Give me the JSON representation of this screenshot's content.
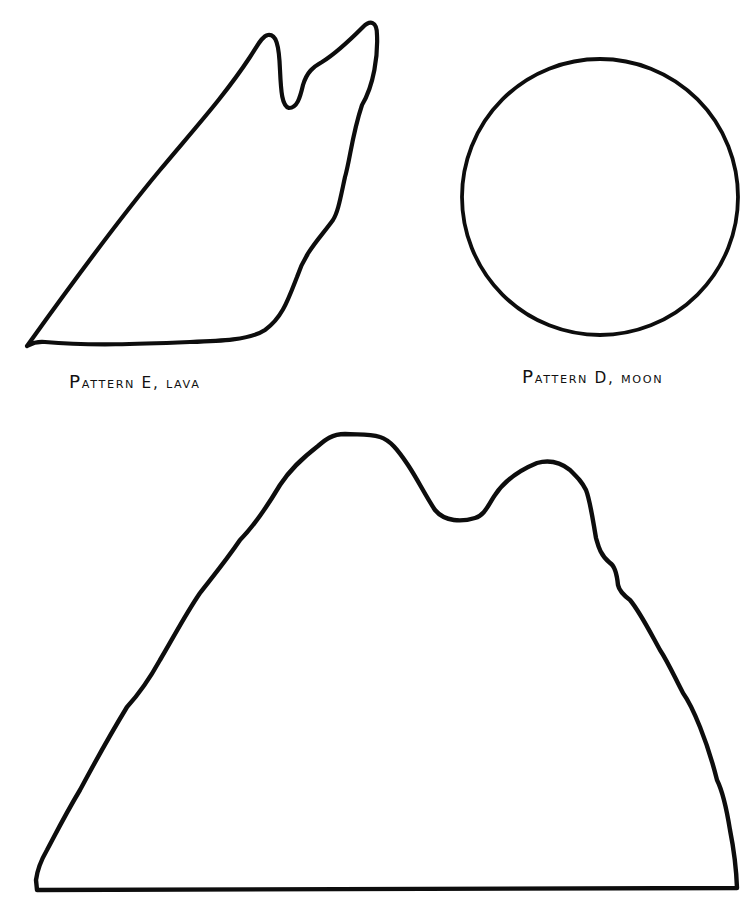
{
  "page": {
    "background": "#ffffff",
    "ink_color": "#0d0d0d"
  },
  "patterns": [
    {
      "id": "E",
      "name": "Lava",
      "label_first": "P",
      "label_rest": "attern E, lava",
      "label": "PATTERN E, LAVA",
      "shape": "lava-outline"
    },
    {
      "id": "D",
      "name": "Moon",
      "label_first": "P",
      "label_rest": "attern D, moon",
      "label": "PATTERN D, MOON",
      "shape": "circle"
    },
    {
      "id": "unlabeled",
      "name": "Mountain",
      "label": "",
      "shape": "twin-peak-mountain-outline"
    }
  ]
}
